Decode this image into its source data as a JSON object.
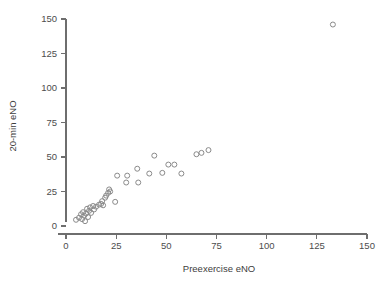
{
  "chart_data": {
    "type": "scatter",
    "title": "",
    "xlabel": "Preexercise eNO",
    "ylabel": "20-min eNO",
    "xlim": [
      0,
      150
    ],
    "ylim": [
      0,
      150
    ],
    "xticks": [
      0,
      25,
      50,
      75,
      100,
      125,
      150
    ],
    "yticks": [
      0,
      25,
      50,
      75,
      100,
      125,
      150
    ],
    "xticklabels": [
      "0",
      "25",
      "50",
      "75",
      "100",
      "125",
      "150"
    ],
    "yticklabels": [
      "0",
      "25",
      "50",
      "75",
      "100",
      "125",
      "150"
    ],
    "grid": false,
    "legend": null,
    "marker": "open-circle",
    "marker_color": "#8a8a8a",
    "n_points": 37,
    "points": [
      {
        "x": 5.0,
        "y": 4.5
      },
      {
        "x": 6.5,
        "y": 6.0
      },
      {
        "x": 7.5,
        "y": 8.5
      },
      {
        "x": 8.0,
        "y": 5.0
      },
      {
        "x": 8.5,
        "y": 10.0
      },
      {
        "x": 9.0,
        "y": 7.5
      },
      {
        "x": 9.5,
        "y": 3.5
      },
      {
        "x": 10.0,
        "y": 9.0
      },
      {
        "x": 10.5,
        "y": 12.5
      },
      {
        "x": 11.0,
        "y": 6.5
      },
      {
        "x": 11.5,
        "y": 11.0
      },
      {
        "x": 12.0,
        "y": 13.5
      },
      {
        "x": 12.5,
        "y": 9.5
      },
      {
        "x": 13.5,
        "y": 14.5
      },
      {
        "x": 14.0,
        "y": 12.0
      },
      {
        "x": 15.0,
        "y": 14.0
      },
      {
        "x": 16.5,
        "y": 15.5
      },
      {
        "x": 17.5,
        "y": 16.0
      },
      {
        "x": 18.0,
        "y": 18.0
      },
      {
        "x": 18.5,
        "y": 15.0
      },
      {
        "x": 19.5,
        "y": 20.5
      },
      {
        "x": 20.0,
        "y": 22.0
      },
      {
        "x": 21.0,
        "y": 24.0
      },
      {
        "x": 21.5,
        "y": 26.5
      },
      {
        "x": 22.0,
        "y": 25.0
      },
      {
        "x": 24.5,
        "y": 17.5
      },
      {
        "x": 25.5,
        "y": 36.5
      },
      {
        "x": 30.0,
        "y": 31.5
      },
      {
        "x": 30.5,
        "y": 36.5
      },
      {
        "x": 35.5,
        "y": 41.5
      },
      {
        "x": 36.0,
        "y": 31.5
      },
      {
        "x": 41.5,
        "y": 38.0
      },
      {
        "x": 44.0,
        "y": 51.0
      },
      {
        "x": 48.0,
        "y": 38.5
      },
      {
        "x": 51.0,
        "y": 44.5
      },
      {
        "x": 54.0,
        "y": 44.5
      },
      {
        "x": 57.5,
        "y": 38.0
      },
      {
        "x": 65.0,
        "y": 52.0
      },
      {
        "x": 67.5,
        "y": 53.0
      },
      {
        "x": 71.0,
        "y": 55.0
      },
      {
        "x": 133.0,
        "y": 146.0
      }
    ]
  },
  "axes": {
    "x_title": "Preexercise eNO",
    "y_title": "20-min eNO"
  }
}
